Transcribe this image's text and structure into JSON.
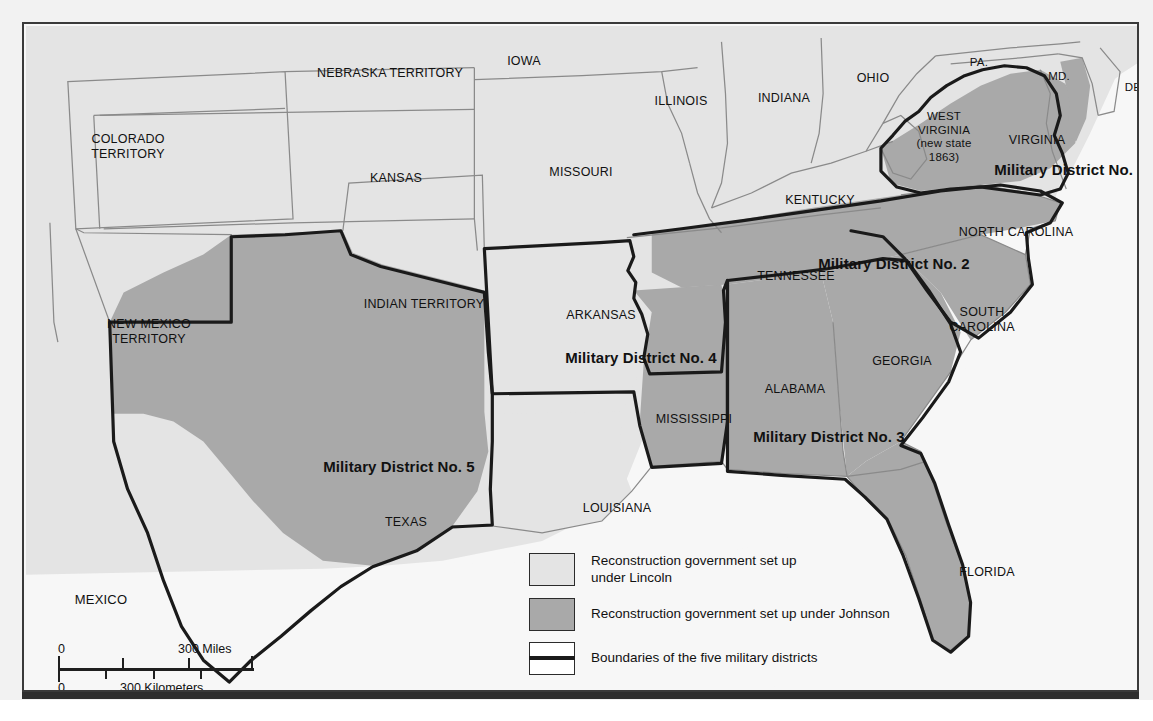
{
  "map": {
    "title": "Reconstruction Military Districts",
    "colors": {
      "lincoln_fill": "#e4e4e4",
      "johnson_fill": "#a9a9a9",
      "ocean": "#f7f7f7",
      "state_border": "#8a8a8a",
      "district_border": "#1a1a1a",
      "frame": "#3a3a3a",
      "text": "#111111"
    },
    "labels": [
      {
        "id": "colorado-territory",
        "text": "COLORADO\nTERRITORY",
        "x": 104,
        "y": 108,
        "style": "state"
      },
      {
        "id": "nebraska-territory",
        "text": "NEBRASKA TERRITORY",
        "x": 366,
        "y": 42,
        "style": "state"
      },
      {
        "id": "iowa",
        "text": "IOWA",
        "x": 500,
        "y": 30,
        "style": "state"
      },
      {
        "id": "illinois",
        "text": "ILLINOIS",
        "x": 657,
        "y": 70,
        "style": "state"
      },
      {
        "id": "indiana",
        "text": "INDIANA",
        "x": 760,
        "y": 67,
        "style": "state"
      },
      {
        "id": "ohio",
        "text": "OHIO",
        "x": 849,
        "y": 47,
        "style": "state"
      },
      {
        "id": "pennsylvania",
        "text": "PA.",
        "x": 955,
        "y": 32,
        "style": "small"
      },
      {
        "id": "maryland",
        "text": "MD.",
        "x": 1035,
        "y": 46,
        "style": "small"
      },
      {
        "id": "delaware",
        "text": "DEL.",
        "x": 1114,
        "y": 57,
        "style": "small"
      },
      {
        "id": "kansas",
        "text": "KANSAS",
        "x": 372,
        "y": 147,
        "style": "state"
      },
      {
        "id": "missouri",
        "text": "MISSOURI",
        "x": 557,
        "y": 141,
        "style": "state"
      },
      {
        "id": "kentucky",
        "text": "KENTUCKY",
        "x": 796,
        "y": 169,
        "style": "state"
      },
      {
        "id": "west-virginia",
        "text": "WEST\nVIRGINIA\n(new state\n1863)",
        "x": 920,
        "y": 86,
        "style": "small"
      },
      {
        "id": "virginia",
        "text": "VIRGINIA",
        "x": 1013,
        "y": 109,
        "style": "state"
      },
      {
        "id": "military-district-1",
        "text": "Military District No. 1",
        "x": 1046,
        "y": 137,
        "style": "district"
      },
      {
        "id": "north-carolina",
        "text": "NORTH CAROLINA",
        "x": 992,
        "y": 201,
        "style": "state"
      },
      {
        "id": "military-district-2",
        "text": "Military District No. 2",
        "x": 870,
        "y": 231,
        "style": "district"
      },
      {
        "id": "tennessee",
        "text": "TENNESSEE",
        "x": 772,
        "y": 245,
        "style": "state"
      },
      {
        "id": "indian-territory",
        "text": "INDIAN TERRITORY",
        "x": 400,
        "y": 273,
        "style": "state"
      },
      {
        "id": "arkansas",
        "text": "ARKANSAS",
        "x": 577,
        "y": 284,
        "style": "state"
      },
      {
        "id": "south-carolina",
        "text": "SOUTH\nCAROLINA",
        "x": 958,
        "y": 281,
        "style": "state"
      },
      {
        "id": "new-mexico-territory",
        "text": "NEW MEXICO\nTERRITORY",
        "x": 125,
        "y": 293,
        "style": "state"
      },
      {
        "id": "military-district-4",
        "text": "Military District No. 4",
        "x": 617,
        "y": 325,
        "style": "district"
      },
      {
        "id": "georgia",
        "text": "GEORGIA",
        "x": 878,
        "y": 330,
        "style": "state"
      },
      {
        "id": "alabama",
        "text": "ALABAMA",
        "x": 771,
        "y": 358,
        "style": "state"
      },
      {
        "id": "mississippi",
        "text": "MISSISSIPPI",
        "x": 670,
        "y": 388,
        "style": "state"
      },
      {
        "id": "military-district-3",
        "text": "Military District No. 3",
        "x": 805,
        "y": 404,
        "style": "district"
      },
      {
        "id": "military-district-5",
        "text": "Military District No. 5",
        "x": 375,
        "y": 434,
        "style": "district"
      },
      {
        "id": "louisiana",
        "text": "LOUISIANA",
        "x": 593,
        "y": 477,
        "style": "state"
      },
      {
        "id": "texas",
        "text": "TEXAS",
        "x": 382,
        "y": 491,
        "style": "state"
      },
      {
        "id": "mexico",
        "text": "MEXICO",
        "x": 77,
        "y": 568,
        "style": "country"
      },
      {
        "id": "florida",
        "text": "FLORIDA",
        "x": 963,
        "y": 541,
        "style": "state"
      }
    ]
  },
  "legend": {
    "items": [
      {
        "id": "lincoln",
        "swatch": "lincoln",
        "text": "Reconstruction government set up\nunder Lincoln"
      },
      {
        "id": "johnson",
        "swatch": "johnson",
        "text": "Reconstruction government set up under Johnson"
      },
      {
        "id": "boundary",
        "swatch": "boundary",
        "text": "Boundaries of the five military districts"
      }
    ]
  },
  "scale": {
    "miles_zero": "0",
    "miles_max": "300 Miles",
    "km_zero": "0",
    "km_max": "300 Kilometers"
  }
}
